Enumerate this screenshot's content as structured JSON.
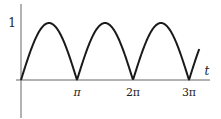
{
  "chart_data": {
    "type": "line",
    "title": "",
    "function": "|sin(t)|",
    "xlabel": "t",
    "ylabel": "",
    "x_ticks": [
      {
        "value": 3.14159,
        "label": "π"
      },
      {
        "value": 6.28319,
        "label": "2π"
      },
      {
        "value": 9.42478,
        "label": "3π"
      }
    ],
    "y_ticks": [
      {
        "value": 1,
        "label": "1"
      }
    ],
    "xlim": [
      0,
      10.0
    ],
    "ylim": [
      0,
      1
    ],
    "grid": false,
    "legend": null,
    "series": [
      {
        "name": "|sin t|",
        "x": [
          0,
          0.785,
          1.571,
          2.356,
          3.142,
          3.927,
          4.712,
          5.498,
          6.283,
          7.069,
          7.854,
          8.639,
          9.425,
          10.0
        ],
        "values": [
          0,
          0.707,
          1,
          0.707,
          0,
          0.707,
          1,
          0.707,
          0,
          0.707,
          1,
          0.707,
          0,
          0.544
        ]
      }
    ]
  },
  "labels": {
    "y_tick_1": "1",
    "x_tick_pi": "π",
    "x_tick_2pi": "2π",
    "x_tick_3pi": "3π",
    "x_axis_label": "t"
  },
  "colors": {
    "curve": "#1a1a1a",
    "axis": "#555555"
  }
}
